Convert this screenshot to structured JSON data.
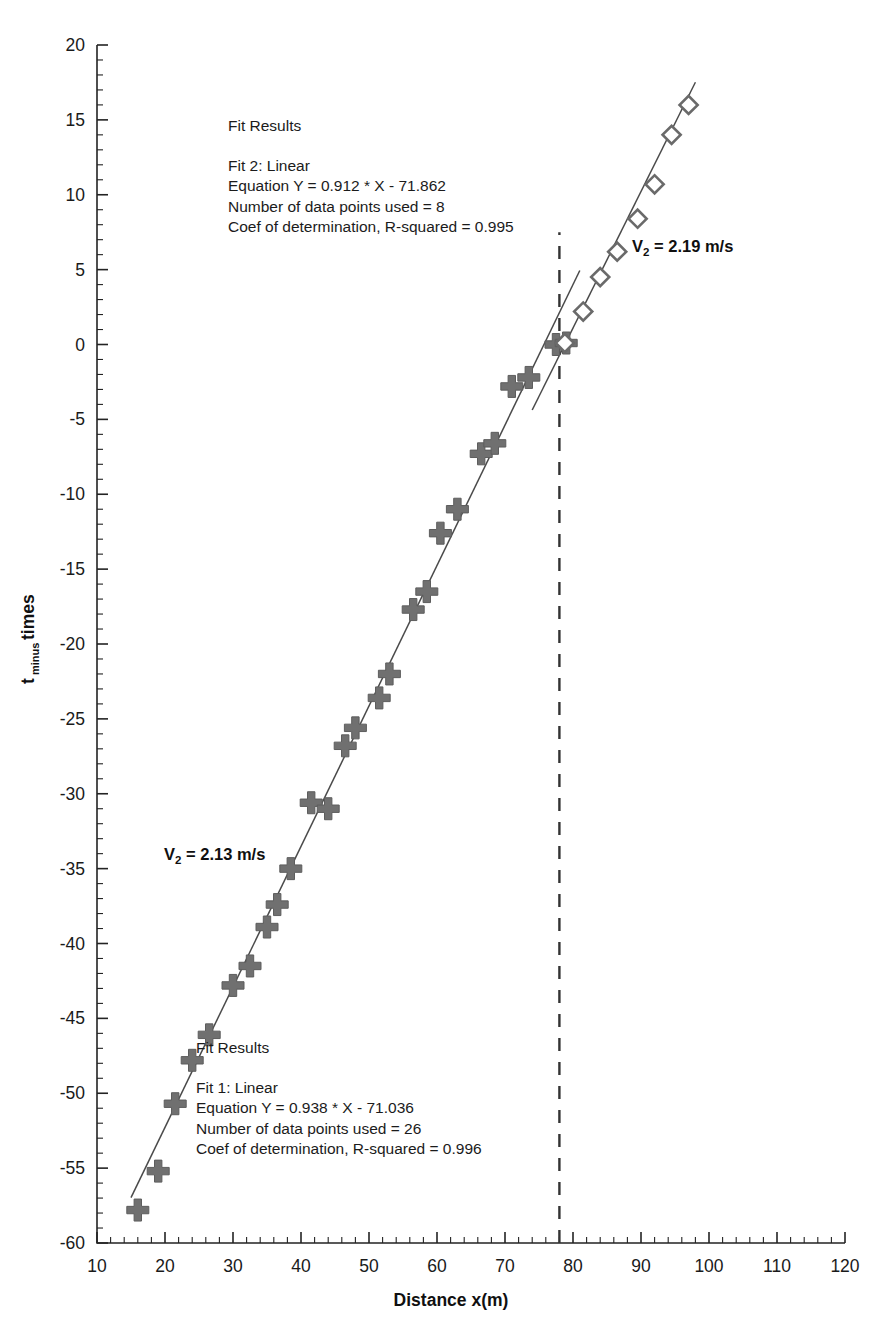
{
  "chart_data": {
    "type": "scatter",
    "title": "",
    "xlabel": "Distance x(m)",
    "ylabel": "t minus times",
    "ylabel_main": "t",
    "ylabel_sub": "minus",
    "ylabel_tail": "times",
    "xlim": [
      10,
      120
    ],
    "ylim": [
      -60,
      20
    ],
    "xticks": [
      10,
      20,
      30,
      40,
      50,
      60,
      70,
      80,
      90,
      100,
      110,
      120
    ],
    "yticks": [
      20,
      15,
      10,
      5,
      0,
      -5,
      -10,
      -15,
      -20,
      -25,
      -30,
      -35,
      -40,
      -45,
      -50,
      -55,
      -60
    ],
    "x_minor_per_major": 5,
    "y_minor_per_major": 5,
    "grid": false,
    "legend": "none",
    "series": [
      {
        "name": "Fit 1 data",
        "marker": "plus",
        "color": "#707070",
        "points": [
          [
            16.0,
            -57.8
          ],
          [
            19.0,
            -55.2
          ],
          [
            21.5,
            -50.7
          ],
          [
            24.0,
            -47.8
          ],
          [
            26.5,
            -46.1
          ],
          [
            30.0,
            -42.8
          ],
          [
            32.5,
            -41.5
          ],
          [
            35.0,
            -38.9
          ],
          [
            36.5,
            -37.4
          ],
          [
            38.5,
            -35.0
          ],
          [
            41.5,
            -30.6
          ],
          [
            44.0,
            -31.0
          ],
          [
            46.5,
            -26.8
          ],
          [
            48.0,
            -25.6
          ],
          [
            51.5,
            -23.6
          ],
          [
            53.0,
            -22.0
          ],
          [
            56.5,
            -17.7
          ],
          [
            58.5,
            -16.5
          ],
          [
            60.5,
            -12.6
          ],
          [
            63.0,
            -11.0
          ],
          [
            66.5,
            -7.3
          ],
          [
            68.5,
            -6.6
          ],
          [
            71.0,
            -2.8
          ],
          [
            73.5,
            -2.2
          ],
          [
            77.5,
            0.0
          ],
          [
            79.0,
            0.1
          ]
        ]
      },
      {
        "name": "Fit 2 data",
        "marker": "diamond",
        "color": "#6a6a6a",
        "points": [
          [
            78.8,
            0.1
          ],
          [
            81.5,
            2.2
          ],
          [
            84.0,
            4.5
          ],
          [
            86.5,
            6.2
          ],
          [
            89.5,
            8.4
          ],
          [
            92.0,
            10.7
          ],
          [
            94.5,
            14.0
          ],
          [
            97.0,
            16.0
          ]
        ]
      }
    ],
    "fit_lines": [
      {
        "name": "Fit 1",
        "slope": 0.938,
        "intercept": -71.036,
        "x_from": 15.0,
        "x_to": 81.0
      },
      {
        "name": "Fit 2",
        "slope": 0.912,
        "intercept": -71.862,
        "x_from": 74.0,
        "x_to": 98.0
      }
    ],
    "divider_line": {
      "type": "vertical-dashed",
      "x": 78.0,
      "y_from": -60,
      "y_to": 7.5
    },
    "annotations": [
      {
        "id": "fit2-results",
        "heading": "Fit Results",
        "lines": [
          "Fit 2: Linear",
          "Equation Y = 0.912 * X - 71.862",
          "Number of data points used = 8",
          "Coef of determination, R-squared = 0.995"
        ]
      },
      {
        "id": "fit1-results",
        "heading": "Fit Results",
        "lines": [
          "Fit 1: Linear",
          "Equation Y = 0.938 * X - 71.036",
          "Number of data points used = 26",
          "Coef of determination, R-squared = 0.996"
        ]
      }
    ],
    "velocity_labels": [
      {
        "id": "velocity-upper",
        "symbol": "V",
        "subscript": "2",
        "text": " = 2.19 m/s"
      },
      {
        "id": "velocity-lower",
        "symbol": "V",
        "subscript": "2",
        "text": " = 2.13 m/s"
      }
    ]
  }
}
